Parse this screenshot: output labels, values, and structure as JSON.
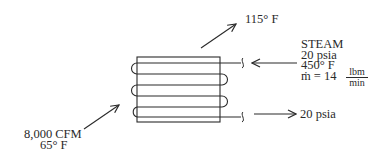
{
  "diagram": {
    "type": "steam heating coil schematic",
    "colors": {
      "stroke": "#2a2a2a",
      "background": "#ffffff"
    },
    "air_outlet": {
      "temperature": "115° F"
    },
    "air_inlet": {
      "flow": "8,000 CFM",
      "temperature": "65° F"
    },
    "steam_inlet": {
      "title": "STEAM",
      "pressure": "20 psia",
      "temperature": "450° F",
      "mass_flow_prefix": "ṁ = 14",
      "mass_flow_unit_num": "lbm",
      "mass_flow_unit_den": "min"
    },
    "steam_outlet": {
      "pressure": "20 psia"
    }
  }
}
